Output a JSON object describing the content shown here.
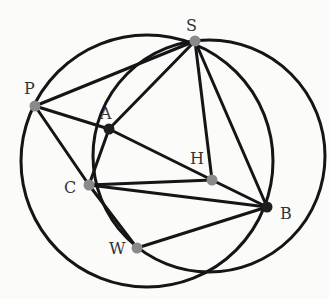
{
  "diagram": {
    "colors": {
      "background": "#fbfbfa",
      "line": "#151515",
      "point_gray": "#8a8a8a",
      "point_dark": "#1e1e1e",
      "label": "#333333"
    },
    "points": [
      {
        "id": "S",
        "label": "S",
        "x": 195,
        "y": 41,
        "fill": "gray",
        "lx": 186,
        "ly": 31
      },
      {
        "id": "P",
        "label": "P",
        "x": 35,
        "y": 106,
        "fill": "gray",
        "lx": 24,
        "ly": 94
      },
      {
        "id": "A",
        "label": "A",
        "x": 109,
        "y": 129,
        "fill": "dark",
        "lx": 100,
        "ly": 119
      },
      {
        "id": "H",
        "label": "H",
        "x": 212,
        "y": 180,
        "fill": "gray",
        "lx": 190,
        "ly": 164
      },
      {
        "id": "C",
        "label": "C",
        "x": 89,
        "y": 185,
        "fill": "gray",
        "lx": 64,
        "ly": 193
      },
      {
        "id": "B",
        "label": "B",
        "x": 267,
        "y": 207,
        "fill": "dark",
        "lx": 280,
        "ly": 219
      },
      {
        "id": "W",
        "label": "W",
        "x": 137,
        "y": 248,
        "fill": "gray",
        "lx": 109,
        "ly": 254
      }
    ],
    "segments": [
      [
        "P",
        "S"
      ],
      [
        "A",
        "S"
      ],
      [
        "H",
        "S"
      ],
      [
        "B",
        "S"
      ],
      [
        "P",
        "A"
      ],
      [
        "P",
        "C"
      ],
      [
        "A",
        "C"
      ],
      [
        "A",
        "H"
      ],
      [
        "H",
        "B"
      ],
      [
        "C",
        "H"
      ],
      [
        "C",
        "B"
      ],
      [
        "C",
        "W"
      ],
      [
        "W",
        "B"
      ]
    ],
    "circles": [
      {
        "id": "left-circle",
        "cx": 147,
        "cy": 161,
        "r": 126
      },
      {
        "id": "right-circle",
        "cx": 209,
        "cy": 156,
        "r": 116
      }
    ]
  }
}
